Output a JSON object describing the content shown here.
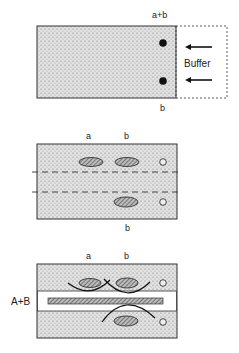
{
  "panels": [
    {
      "id": "panel-1",
      "labels": {
        "top": "a+b",
        "bottom": "b",
        "side": "Buffer"
      },
      "description": "Gel strip with sample wells at right edge, buffer applied from right"
    },
    {
      "id": "panel-2",
      "labels": {
        "top_a": "a",
        "top_b": "b",
        "bottom": "b"
      },
      "description": "Separated spots a and b, cut lines dashed"
    },
    {
      "id": "panel-3",
      "labels": {
        "top_a": "a",
        "top_b": "b",
        "left": "A+B"
      },
      "description": "Center strip removed and replaced with antiserum A+B, precipitation arcs form"
    }
  ],
  "colors": {
    "gel": "#d9d9d9",
    "ink": "#222222",
    "background": "#ffffff"
  }
}
